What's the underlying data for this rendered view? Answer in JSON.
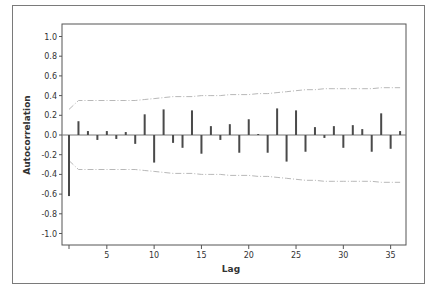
{
  "chart_data": {
    "type": "bar",
    "subtype": "autocorrelation-function",
    "title": "",
    "xlabel": "Lag",
    "ylabel": "Autocorrelation",
    "ylim": [
      -1.0,
      1.0
    ],
    "xlim": [
      1,
      36
    ],
    "yticks": [
      "1.0",
      "0.8",
      "0.6",
      "0.4",
      "0.2",
      "0.0",
      "-0.2",
      "-0.4",
      "-0.6",
      "-0.8",
      "-1.0"
    ],
    "xticks": [
      "5",
      "10",
      "15",
      "20",
      "25",
      "30",
      "35"
    ],
    "grid": false,
    "legend": null,
    "x": [
      1,
      2,
      3,
      4,
      5,
      6,
      7,
      8,
      9,
      10,
      11,
      12,
      13,
      14,
      15,
      16,
      17,
      18,
      19,
      20,
      21,
      22,
      23,
      24,
      25,
      26,
      27,
      28,
      29,
      30,
      31,
      32,
      33,
      34,
      35,
      36
    ],
    "values": [
      -0.62,
      0.14,
      0.04,
      -0.05,
      0.04,
      -0.04,
      0.03,
      -0.09,
      0.21,
      -0.28,
      0.26,
      -0.08,
      -0.13,
      0.25,
      -0.19,
      0.09,
      -0.05,
      0.11,
      -0.18,
      0.16,
      0.01,
      -0.18,
      0.27,
      -0.27,
      0.25,
      -0.17,
      0.08,
      -0.03,
      0.09,
      -0.13,
      0.1,
      0.06,
      -0.17,
      0.22,
      -0.14,
      0.04
    ],
    "confidence_limits": {
      "upper": [
        0.26,
        0.35,
        0.35,
        0.35,
        0.35,
        0.35,
        0.35,
        0.35,
        0.36,
        0.37,
        0.38,
        0.39,
        0.39,
        0.39,
        0.4,
        0.4,
        0.4,
        0.41,
        0.41,
        0.41,
        0.42,
        0.42,
        0.43,
        0.44,
        0.45,
        0.46,
        0.46,
        0.47,
        0.47,
        0.47,
        0.47,
        0.47,
        0.47,
        0.48,
        0.48,
        0.48
      ],
      "lower": [
        -0.26,
        -0.35,
        -0.35,
        -0.35,
        -0.35,
        -0.35,
        -0.35,
        -0.35,
        -0.36,
        -0.37,
        -0.38,
        -0.39,
        -0.39,
        -0.39,
        -0.4,
        -0.4,
        -0.4,
        -0.41,
        -0.41,
        -0.41,
        -0.42,
        -0.42,
        -0.43,
        -0.44,
        -0.45,
        -0.46,
        -0.46,
        -0.47,
        -0.47,
        -0.47,
        -0.47,
        -0.47,
        -0.47,
        -0.48,
        -0.48,
        -0.48
      ],
      "style": "dash-dot"
    },
    "colors": {
      "bar": "#4a4a4a",
      "limits": "#b8b8b8",
      "axis": "#555555"
    }
  }
}
